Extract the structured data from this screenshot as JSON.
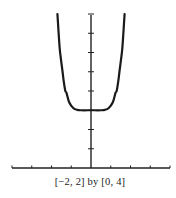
{
  "chart_data": {
    "type": "line",
    "title": "",
    "caption": "[−2, 2] by [0, 4]",
    "xlabel": "",
    "ylabel": "",
    "xlim": [
      -2,
      2
    ],
    "ylim": [
      0,
      4
    ],
    "x_tick_step": 0.5,
    "y_tick_step": 0.5,
    "grid": false,
    "tick_labels": false,
    "series": [
      {
        "name": "f(x)",
        "description": "even, flat-bottomed curve with minimum 1.5 at x = 0, rising steeply to leave the window near x = ±0.85",
        "x": [
          -0.85,
          -0.8,
          -0.77,
          -0.72,
          -0.69,
          -0.65,
          -0.62,
          -0.55,
          -0.45,
          -0.35,
          -0.25,
          0,
          0.25,
          0.35,
          0.45,
          0.55,
          0.62,
          0.65,
          0.69,
          0.72,
          0.77,
          0.8,
          0.85
        ],
        "y": [
          4.0,
          3.2,
          2.9,
          2.5,
          2.25,
          2.0,
          1.95,
          1.7,
          1.56,
          1.51,
          1.5,
          1.5,
          1.5,
          1.51,
          1.56,
          1.7,
          1.95,
          2.0,
          2.25,
          2.5,
          2.9,
          3.2,
          4.0
        ]
      }
    ],
    "colors": {
      "curve": "#1a1a1a",
      "axes": "#222222"
    }
  }
}
